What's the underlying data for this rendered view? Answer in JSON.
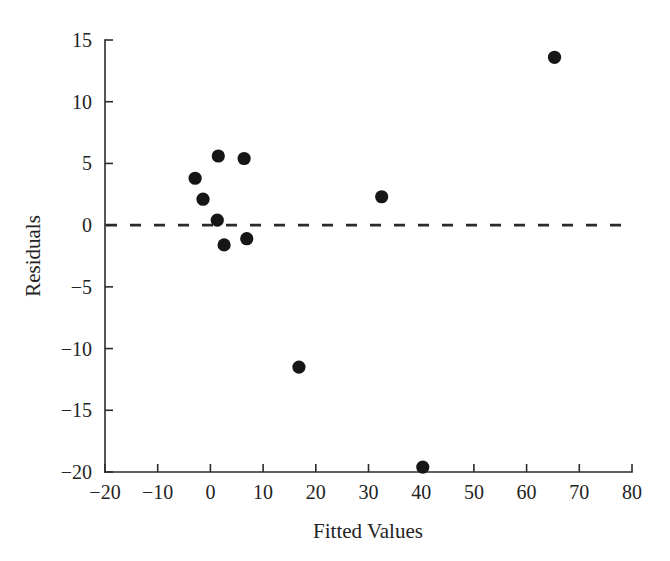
{
  "chart_data": {
    "type": "scatter",
    "title": "",
    "xlabel": "Fitted Values",
    "ylabel": "Residuals",
    "xlim": [
      -20,
      80
    ],
    "ylim": [
      -20,
      15
    ],
    "xticks": [
      -20,
      -10,
      0,
      10,
      20,
      30,
      40,
      50,
      60,
      70,
      80
    ],
    "xticklabels": [
      "−20",
      "−10",
      "0",
      "10",
      "20",
      "30",
      "40",
      "50",
      "60",
      "70",
      "80"
    ],
    "yticks": [
      15,
      10,
      5,
      0,
      -5,
      -10,
      -15,
      -20
    ],
    "yticklabels": [
      "15",
      "10",
      "5",
      "0",
      "−5",
      "−10",
      "−15",
      "−20"
    ],
    "grid": false,
    "legend": false,
    "marker": "filled-circle",
    "marker_color": "#161616",
    "marker_size": 7,
    "reference_line": {
      "type": "horizontal",
      "y": 0,
      "style": "dashed",
      "color": "#2b2b2b"
    },
    "points": [
      {
        "x": -2.9,
        "y": 3.8
      },
      {
        "x": -1.4,
        "y": 2.1
      },
      {
        "x": 1.5,
        "y": 5.6
      },
      {
        "x": 1.3,
        "y": 0.4
      },
      {
        "x": 2.6,
        "y": -1.6
      },
      {
        "x": 6.4,
        "y": 5.4
      },
      {
        "x": 6.9,
        "y": -1.1
      },
      {
        "x": 16.8,
        "y": -11.5
      },
      {
        "x": 32.5,
        "y": 2.3
      },
      {
        "x": 40.3,
        "y": -19.6
      },
      {
        "x": 65.3,
        "y": 13.6
      }
    ]
  },
  "figure": {
    "caption": "",
    "background": "#ffffff",
    "axis_color": "#2b2b2b"
  }
}
